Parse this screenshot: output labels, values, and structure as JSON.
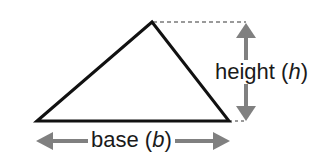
{
  "diagram": {
    "shape": "triangle",
    "labels": {
      "height_word": "height (",
      "height_var": "h",
      "height_close": ")",
      "base_word": "base (",
      "base_var": "b",
      "base_close": ")"
    },
    "colors": {
      "triangle_stroke": "#111111",
      "arrow": "#808080",
      "dashed_guide": "#9a9a9a",
      "text": "#1a1a1a"
    }
  }
}
